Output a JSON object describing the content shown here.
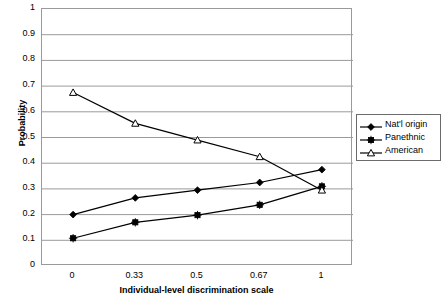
{
  "chart_data": {
    "type": "line",
    "title": "",
    "xlabel": "Individual-level discrimination scale",
    "ylabel": "Probability",
    "categories": [
      "0",
      "0.33",
      "0.5",
      "0.67",
      "1"
    ],
    "ylim": [
      0,
      1
    ],
    "ytick_step": 0.1,
    "yticks": [
      "1",
      "0.9",
      "0.8",
      "0.7",
      "0.6",
      "0.5",
      "0.4",
      "0.3",
      "0.2",
      "0.1",
      "0"
    ],
    "grid": "horizontal",
    "legend_position": "right",
    "series": [
      {
        "name": "Nat'l origin",
        "marker": "filled-diamond",
        "color": "#000000",
        "values": [
          0.2,
          0.265,
          0.295,
          0.325,
          0.375
        ]
      },
      {
        "name": "Panethnic",
        "marker": "filled-square",
        "color": "#000000",
        "values": [
          0.108,
          0.17,
          0.198,
          0.238,
          0.31
        ]
      },
      {
        "name": "American",
        "marker": "open-triangle",
        "color": "#000000",
        "values": [
          0.675,
          0.555,
          0.49,
          0.425,
          0.295
        ]
      }
    ]
  },
  "axes": {
    "y_title": "Probability",
    "x_title": "Individual-level discrimination scale"
  },
  "legend": {
    "items": [
      {
        "label": "Nat'l origin"
      },
      {
        "label": "Panethnic"
      },
      {
        "label": "American"
      }
    ]
  },
  "colors": {
    "line": "#000000",
    "gridline": "#9a9a9a",
    "plot_border": "#9a9a9a",
    "legend_border": "#6b6b6b",
    "background": "#ffffff"
  }
}
